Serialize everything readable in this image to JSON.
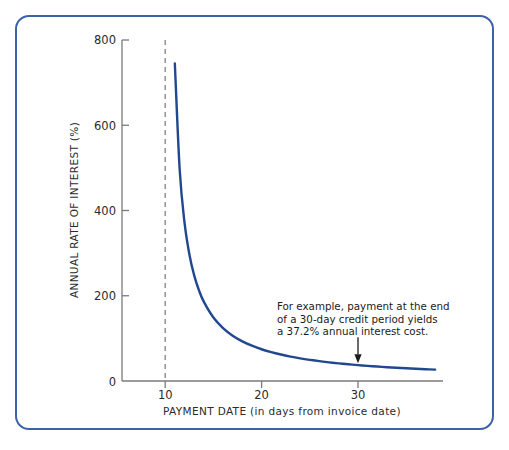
{
  "figure": {
    "border_color": "#3d62a8",
    "background": "#ffffff"
  },
  "chart_data": {
    "type": "line",
    "title": "",
    "xlabel": "PAYMENT DATE (in days from invoice date)",
    "ylabel": "ANNUAL RATE OF INTEREST (%)",
    "xlim": [
      6,
      39
    ],
    "ylim": [
      0,
      800
    ],
    "grid": false,
    "legend": null,
    "line_color": "#21488f",
    "x_ticks": [
      10,
      20,
      30
    ],
    "x_tick_labels": [
      "10",
      "20",
      "30"
    ],
    "y_ticks": [
      0,
      200,
      400,
      600,
      800
    ],
    "y_tick_labels": [
      "0",
      "200",
      "400",
      "600",
      "800"
    ],
    "series": [
      {
        "name": "Annual rate of interest",
        "x": [
          11,
          11.5,
          12,
          12.5,
          13,
          13.5,
          14,
          15,
          16,
          17,
          18,
          19,
          20,
          21,
          22,
          23,
          24,
          25,
          26,
          27,
          28,
          29,
          30,
          31,
          32,
          33,
          34,
          35,
          36,
          37,
          38
        ],
        "values": [
          745,
          496.7,
          372.5,
          298,
          248.3,
          212.9,
          186.2,
          149,
          124.2,
          106.4,
          93.1,
          82.8,
          74.5,
          67.7,
          62.1,
          57.3,
          53.2,
          49.7,
          46.6,
          43.8,
          41.4,
          39.2,
          37.2,
          35.5,
          33.9,
          32.4,
          31,
          29.8,
          28.7,
          27.6,
          26.6
        ]
      }
    ],
    "reference_line": {
      "name": "discount-period-marker",
      "x": 10,
      "style": "dashed",
      "color": "#8a8a8a"
    },
    "annotations": [
      {
        "name": "example-callout",
        "lines": [
          "For example, payment at the end",
          "of a 30-day credit period yields",
          "a 37.2% annual interest cost."
        ],
        "arrow_target_x": 30,
        "arrow_target_y": 37.2
      }
    ]
  }
}
